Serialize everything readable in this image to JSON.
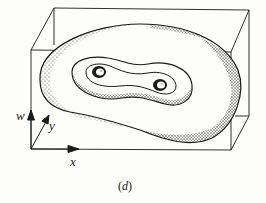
{
  "figure": {
    "caption": "(d)",
    "caption_letter": "d",
    "axes": {
      "x_label": "x",
      "y_label": "y",
      "w_label": "w"
    },
    "colors": {
      "background": "#fdfdfb",
      "ink": "#1a1a1a"
    }
  }
}
